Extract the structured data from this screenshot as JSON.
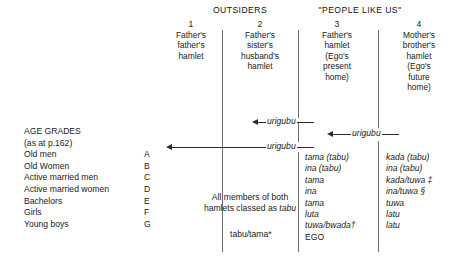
{
  "diagram": {
    "group_headers": [
      {
        "label": "OUTSIDERS"
      },
      {
        "label": "\"PEOPLE LIKE US\""
      }
    ],
    "columns": [
      {
        "number": "1",
        "lines": [
          "Father's",
          "father's",
          "hamlet"
        ]
      },
      {
        "number": "2",
        "lines": [
          "Father's",
          "sister's",
          "husband's",
          "hamlet"
        ]
      },
      {
        "number": "3",
        "lines": [
          "Father's",
          "hamlet",
          "(Ego's",
          "present",
          "home)"
        ]
      },
      {
        "number": "4",
        "lines": [
          "Mother's",
          "brother's",
          "hamlet",
          "(Ego's",
          "future",
          "home)"
        ]
      }
    ],
    "arrows": [
      {
        "label": "urigubu"
      },
      {
        "label": "urigubu"
      },
      {
        "label": "urigubu"
      }
    ],
    "age_grades": {
      "title_line1": "AGE GRADES",
      "title_line2": "(as at p.162)",
      "rows": [
        {
          "label": "Old men",
          "letter": "A"
        },
        {
          "label": "Old Women",
          "letter": "B"
        },
        {
          "label": "Active married men",
          "letter": "C"
        },
        {
          "label": "Active married women",
          "letter": "D"
        },
        {
          "label": "Bachelors",
          "letter": "E"
        },
        {
          "label": "Girls",
          "letter": "F"
        },
        {
          "label": "Young boys",
          "letter": "G"
        }
      ]
    },
    "middle_note": {
      "line1": "All members of both",
      "line2_prefix": "hamlets classed as ",
      "line2_italic": "tabu"
    },
    "column2_term": "tabu/tama*",
    "column3_terms": [
      "tama (tabu)",
      "ina (tabu)",
      "tama",
      "ina",
      "tama",
      "luta",
      "tuwa/bwada†",
      "EGO"
    ],
    "column4_terms": [
      "kada (tabu)",
      "ina (tabu)",
      "kada/tuwa ‡",
      "ina/tuwa §",
      "tuwa",
      "latu",
      "latu"
    ],
    "colors": {
      "background": "#ffffff",
      "text": "#1a1a1a",
      "rule": "#6f6f6f",
      "arrow": "#2b2b2b"
    }
  }
}
